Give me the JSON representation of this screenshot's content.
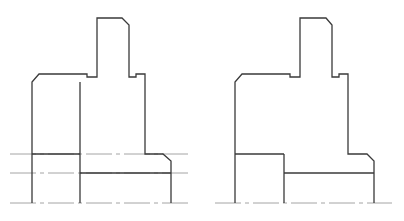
{
  "figure": {
    "width": 404,
    "height": 221,
    "colors": {
      "outline": "#3a3a3a",
      "centerline": "#9a9a9a",
      "background": "#ffffff"
    },
    "views": [
      {
        "name": "left-view",
        "outline_path": "M32,203 L32,82 L39,74 L87,74 L87,77 L97,77 L97,18 L122,18 L129,25 L129,77 L136,77 L136,74 L145,74 L145,154 L163,154 L171,161 L171,203",
        "inner_lines": [
          {
            "name": "inner-vertical",
            "d": "M80,82 L80,203"
          },
          {
            "name": "lower-left-horizontal",
            "d": "M32,154 L80,154"
          },
          {
            "name": "lower-right-horizontal",
            "d": "M80,173 L171,173"
          }
        ],
        "center_lines": [
          {
            "name": "centerline-upper",
            "d": "M10,154 L188,154"
          },
          {
            "name": "centerline-middle",
            "d": "M10,173 L188,173"
          },
          {
            "name": "centerline-base",
            "d": "M10,203 L188,203"
          }
        ]
      },
      {
        "name": "right-view",
        "outline_path": "M235,203 L235,82 L242,74 L290,74 L290,77 L300,77 L300,18 L326,18 L332,25 L332,77 L339,77 L339,74 L348,74 L348,154 L367,154 L374,161 L374,203",
        "inner_lines": [
          {
            "name": "inner-vertical",
            "d": "M284,154 L284,203"
          },
          {
            "name": "lower-left-horizontal",
            "d": "M235,154 L284,154"
          },
          {
            "name": "lower-right-horizontal",
            "d": "M284,173 L374,173"
          }
        ],
        "center_lines": [
          {
            "name": "centerline-base",
            "d": "M215,203 L392,203"
          }
        ]
      }
    ]
  }
}
